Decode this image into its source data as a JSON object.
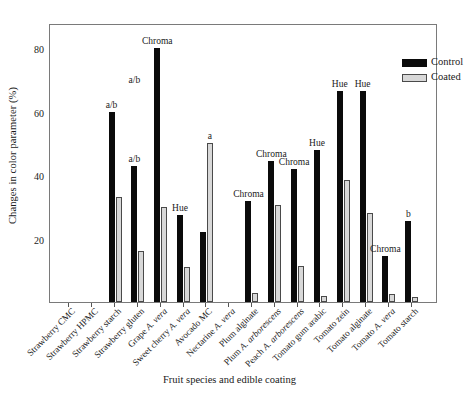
{
  "chart_data": {
    "type": "bar",
    "title": "",
    "xlabel": "Fruit species and edible coating",
    "ylabel": "Changes in color parameter (%)",
    "ylim": [
      0,
      88
    ],
    "yticks": [
      20,
      40,
      60,
      80
    ],
    "grid": false,
    "legend_position": "top-right",
    "categories": [
      "Strawberry CMC",
      "Strawberry HPMC",
      "Strawberry starch",
      "Strawberry gluten",
      "Grape A. vera",
      "Sweet cherry A. vera",
      "Avocado MC",
      "Nectarine A. vera",
      "Plum alginate",
      "Plum A. arborescens",
      "Peach A. arborescens",
      "Tomato gum arabic",
      "Tomato zein",
      "Tomato alginate",
      "Tomato A. vera",
      "Tomato starch"
    ],
    "categories_display": [
      {
        "text": "Strawberry CMC",
        "italic_tail": ""
      },
      {
        "text": "Strawberry HPMC",
        "italic_tail": ""
      },
      {
        "text": "Strawberry starch",
        "italic_tail": ""
      },
      {
        "text": "Strawberry gluten",
        "italic_tail": ""
      },
      {
        "text": "Grape ",
        "italic_tail": "A. vera"
      },
      {
        "text": "Sweet cherry ",
        "italic_tail": "A. vera"
      },
      {
        "text": "Avocado MC",
        "italic_tail": ""
      },
      {
        "text": "Nectarine ",
        "italic_tail": "A. vera"
      },
      {
        "text": "Plum alginate",
        "italic_tail": ""
      },
      {
        "text": "Plum ",
        "italic_tail": "A. arborescens"
      },
      {
        "text": "Peach ",
        "italic_tail": "A. arborescens"
      },
      {
        "text": "Tomato gum arabic",
        "italic_tail": ""
      },
      {
        "text": "Tomato zein",
        "italic_tail": ""
      },
      {
        "text": "Tomato alginate",
        "italic_tail": ""
      },
      {
        "text": "Tomato ",
        "italic_tail": "A. vera"
      },
      {
        "text": "Tomato starch",
        "italic_tail": ""
      }
    ],
    "series": [
      {
        "name": "Control",
        "color": "#0b0b0b",
        "values": [
          0,
          0,
          60,
          43,
          80,
          27.5,
          22,
          0,
          32,
          44.5,
          42,
          48,
          66.5,
          66.5,
          14.5,
          25.5
        ]
      },
      {
        "name": "Coated",
        "color": "#d8d8d8",
        "values": [
          0,
          0,
          33,
          16,
          30,
          11,
          50,
          0,
          3,
          30.5,
          11.5,
          2,
          38.5,
          28,
          2.5,
          1.5
        ]
      }
    ],
    "annotations": [
      {
        "category_index": 2,
        "text": "a/b",
        "series": "control"
      },
      {
        "category_index": 3,
        "text": "a/b",
        "series": "control"
      },
      {
        "category_index": 4,
        "text": "Chroma",
        "series": "control"
      },
      {
        "category_index": 5,
        "text": "Hue",
        "series": "control"
      },
      {
        "category_index": 6,
        "text": "a",
        "series": "coated"
      },
      {
        "category_index": 8,
        "text": "Chroma",
        "series": "control"
      },
      {
        "category_index": 9,
        "text": "Chroma",
        "series": "control"
      },
      {
        "category_index": 10,
        "text": "Chroma",
        "series": "control"
      },
      {
        "category_index": 11,
        "text": "Hue",
        "series": "control"
      },
      {
        "category_index": 12,
        "text": "Hue",
        "series": "control"
      },
      {
        "category_index": 13,
        "text": "Hue",
        "series": "control"
      },
      {
        "category_index": 14,
        "text": "Chroma",
        "series": "control"
      },
      {
        "category_index": 15,
        "text": "b",
        "series": "control"
      }
    ],
    "extra_annotation_above_group3": "a/b"
  },
  "legend": {
    "entries": [
      {
        "label": "Control"
      },
      {
        "label": "Coated"
      }
    ]
  }
}
